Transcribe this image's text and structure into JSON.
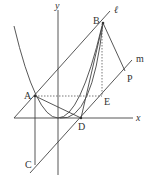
{
  "labels": {
    "y_axis": "y",
    "x_axis": "x",
    "line_l": "ℓ",
    "line_m": "m",
    "A": "A",
    "B": "B",
    "C": "C",
    "D": "D",
    "E": "E",
    "P": "P"
  }
}
